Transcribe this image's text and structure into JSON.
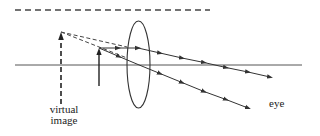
{
  "diagram": {
    "type": "optics-magnifier-ray-diagram",
    "labels": {
      "virtual_image_line1": "virtual",
      "virtual_image_line2": "image",
      "eye": "eye"
    },
    "elements": [
      "optical-axis",
      "converging-lens",
      "object-arrow",
      "virtual-image-arrow",
      "rays",
      "dashed-backward-extensions",
      "top-dashed-line"
    ],
    "colors": {
      "line": "#333333",
      "background": "#ffffff"
    }
  }
}
